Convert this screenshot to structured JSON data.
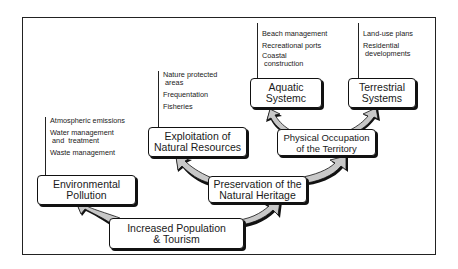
{
  "diagram": {
    "nodes": {
      "increased_population": {
        "line1": "Increased Population",
        "line2": "& Tourism"
      },
      "environmental_pollution": {
        "line1": "Environmental",
        "line2": "Pollution"
      },
      "preservation": {
        "line1": "Preservation of the",
        "line2": "Natural Heritage"
      },
      "exploitation": {
        "line1": "Exploitation of",
        "line2": "Natural Resources"
      },
      "physical_occupation": {
        "line1": "Physical Occupation",
        "line2": "of the Territory"
      },
      "aquatic": {
        "line1": "Aquatic",
        "line2": "Systemc"
      },
      "terrestrial": {
        "line1": "Terrestrial",
        "line2": "Systems"
      }
    },
    "lists": {
      "pollution_items": [
        "Atmospheric emissions",
        "Water management\n and  treatment",
        "Waste management"
      ],
      "exploitation_items": [
        "Nature protected\n areas",
        "Frequentation",
        "Fisheries"
      ],
      "aquatic_items": [
        "Beach management",
        "Recreational ports",
        "Coastal\n construction"
      ],
      "terrestrial_items": [
        "Land-use plans",
        "Residential\n developments"
      ]
    },
    "edges": [
      {
        "from": "Increased Population & Tourism",
        "to": "Environmental Pollution"
      },
      {
        "from": "Increased Population & Tourism",
        "to": "Preservation of the Natural Heritage"
      },
      {
        "from": "Preservation of the Natural Heritage",
        "to": "Exploitation of Natural Resources"
      },
      {
        "from": "Preservation of the Natural Heritage",
        "to": "Physical Occupation of the Territory"
      },
      {
        "from": "Physical Occupation of the Territory",
        "to": "Aquatic Systemc"
      },
      {
        "from": "Physical Occupation of the Territory",
        "to": "Terrestrial Systems"
      }
    ],
    "colors": {
      "arrow_fill": "#c8c8c8",
      "arrow_shadow": "#111111",
      "border": "#111111"
    }
  }
}
